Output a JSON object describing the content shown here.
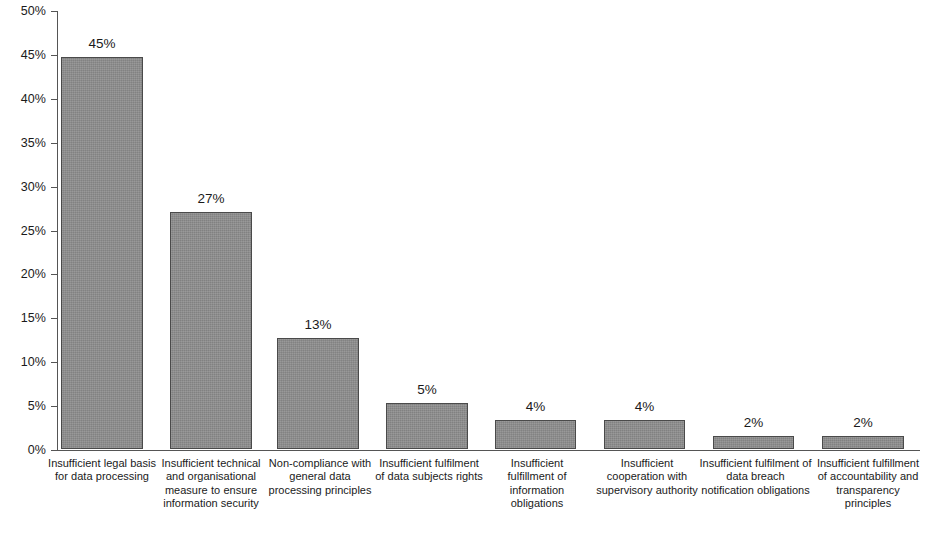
{
  "chart_data": {
    "type": "bar",
    "title": "",
    "xlabel": "",
    "ylabel": "",
    "ylim": [
      0,
      50
    ],
    "grid": false,
    "legend": false,
    "bar_color": "#8d8d8d",
    "axis_color": "#555555",
    "y_ticks": [
      "0%",
      "5%",
      "10%",
      "15%",
      "20%",
      "25%",
      "30%",
      "35%",
      "40%",
      "45%",
      "50%"
    ],
    "y_tick_values": [
      0,
      5,
      10,
      15,
      20,
      25,
      30,
      35,
      40,
      45,
      50
    ],
    "categories": [
      "Insufficient legal basis for data processing",
      "Insufficient technical and organisational measure to ensure information security",
      "Non-compliance with general data processing principles",
      "Insufficient fulfilment of data subjects rights",
      "Insufficient fulfillment of information obligations",
      "Insufficient cooperation with supervisory authority",
      "Insufficient fulfilment of data breach notification obligations",
      "Insufficient fulfillment of accountability and transparency principles"
    ],
    "values": [
      44.7,
      27.0,
      12.6,
      5.2,
      3.3,
      3.3,
      1.5,
      1.5
    ],
    "data_labels": [
      "45%",
      "27%",
      "13%",
      "5%",
      "4%",
      "4%",
      "2%",
      "2%"
    ]
  }
}
